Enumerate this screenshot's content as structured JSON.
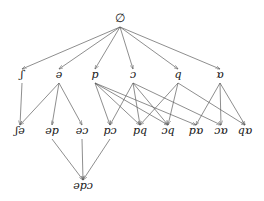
{
  "diagram": {
    "type": "hasse-lattice",
    "title": "",
    "background_color": "#ffffff",
    "edge_color": "#5d5d5d",
    "label_color": "#161616",
    "arrowheads": true,
    "nodes": [
      {
        "id": "root",
        "label": "∅",
        "x": 120,
        "y": 22,
        "level": 0
      },
      {
        "id": "esh",
        "label": "ʃ",
        "x": 22,
        "y": 78,
        "level": 1
      },
      {
        "id": "schwa",
        "label": "ə",
        "x": 59,
        "y": 78,
        "level": 1
      },
      {
        "id": "p",
        "label": "p",
        "x": 95,
        "y": 78,
        "level": 1
      },
      {
        "id": "openo",
        "label": "ɔ",
        "x": 133,
        "y": 78,
        "level": 1
      },
      {
        "id": "q",
        "label": "q",
        "x": 178,
        "y": 78,
        "level": 1
      },
      {
        "id": "alpha",
        "label": "ɒ",
        "x": 220,
        "y": 78,
        "level": 1
      },
      {
        "id": "esh-schwa",
        "label": "ʃə",
        "x": 20,
        "y": 134,
        "level": 2
      },
      {
        "id": "schwa-p",
        "label": "əp",
        "x": 52,
        "y": 134,
        "level": 2
      },
      {
        "id": "schwa-openo",
        "label": "əɔ",
        "x": 82,
        "y": 134,
        "level": 2
      },
      {
        "id": "p-openo",
        "label": "pɔ",
        "x": 110,
        "y": 134,
        "level": 2
      },
      {
        "id": "p-q",
        "label": "pq",
        "x": 140,
        "y": 134,
        "level": 2
      },
      {
        "id": "openo-q",
        "label": "ɔq",
        "x": 168,
        "y": 134,
        "level": 2
      },
      {
        "id": "p-alpha",
        "label": "pɒ",
        "x": 196,
        "y": 134,
        "level": 2
      },
      {
        "id": "openo-alpha",
        "label": "ɔɒ",
        "x": 221,
        "y": 134,
        "level": 2
      },
      {
        "id": "q-alpha",
        "label": "qɒ",
        "x": 245,
        "y": 134,
        "level": 2
      },
      {
        "id": "schwa-p-openo",
        "label": "əpɔ",
        "x": 83,
        "y": 189,
        "level": 3
      }
    ],
    "edges": [
      {
        "from": "root",
        "to": "esh"
      },
      {
        "from": "root",
        "to": "schwa"
      },
      {
        "from": "root",
        "to": "p"
      },
      {
        "from": "root",
        "to": "openo"
      },
      {
        "from": "root",
        "to": "q"
      },
      {
        "from": "root",
        "to": "alpha"
      },
      {
        "from": "esh",
        "to": "esh-schwa"
      },
      {
        "from": "schwa",
        "to": "esh-schwa"
      },
      {
        "from": "schwa",
        "to": "schwa-p"
      },
      {
        "from": "schwa",
        "to": "schwa-openo"
      },
      {
        "from": "p",
        "to": "p-openo"
      },
      {
        "from": "p",
        "to": "p-q"
      },
      {
        "from": "p",
        "to": "openo-q"
      },
      {
        "from": "p",
        "to": "p-alpha"
      },
      {
        "from": "openo",
        "to": "p-openo"
      },
      {
        "from": "openo",
        "to": "openo-q"
      },
      {
        "from": "openo",
        "to": "p-q"
      },
      {
        "from": "openo",
        "to": "openo-alpha"
      },
      {
        "from": "q",
        "to": "p-q"
      },
      {
        "from": "q",
        "to": "openo-q"
      },
      {
        "from": "q",
        "to": "q-alpha"
      },
      {
        "from": "alpha",
        "to": "p-alpha"
      },
      {
        "from": "alpha",
        "to": "openo-alpha"
      },
      {
        "from": "alpha",
        "to": "q-alpha"
      },
      {
        "from": "schwa-p",
        "to": "schwa-p-openo"
      },
      {
        "from": "schwa-openo",
        "to": "schwa-p-openo"
      },
      {
        "from": "p-openo",
        "to": "schwa-p-openo"
      }
    ]
  }
}
